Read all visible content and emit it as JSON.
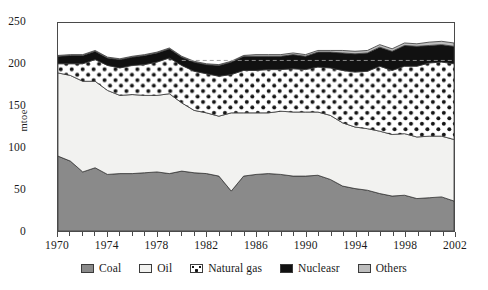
{
  "chart_data": {
    "type": "area",
    "stacked": true,
    "title": "",
    "subtitle": "",
    "xlabel": "",
    "ylabel": "mtoe",
    "xlim": [
      1970,
      2002
    ],
    "ylim": [
      0,
      250
    ],
    "grid": false,
    "legend_position": "bottom",
    "y_ticks": [
      0,
      50,
      100,
      150,
      200,
      250
    ],
    "x_ticks": [
      1970,
      1974,
      1978,
      1982,
      1986,
      1990,
      1994,
      1998,
      2002
    ],
    "x_minor_tick_interval": 1,
    "x": [
      1970,
      1971,
      1972,
      1973,
      1974,
      1975,
      1976,
      1977,
      1978,
      1979,
      1980,
      1981,
      1982,
      1983,
      1984,
      1985,
      1986,
      1987,
      1988,
      1989,
      1990,
      1991,
      1992,
      1993,
      1994,
      1995,
      1996,
      1997,
      1998,
      1999,
      2000,
      2001,
      2002
    ],
    "annotations": [
      {
        "type": "dashed-line",
        "orientation": "horizontal",
        "y": 205,
        "x_start": 1980,
        "x_end": 2002,
        "note": "faint reference line near 205 mtoe"
      }
    ],
    "series": [
      {
        "name": "Coal",
        "color": "#8a8a8a",
        "pattern": "solid-grey",
        "values": [
          90,
          84,
          71,
          76,
          68,
          69,
          69,
          70,
          71,
          69,
          72,
          70,
          69,
          66,
          48,
          66,
          68,
          69,
          68,
          66,
          66,
          67,
          62,
          54,
          51,
          49,
          45,
          42,
          43,
          39,
          40,
          41,
          36
        ]
      },
      {
        "name": "Oil",
        "color": "#f2f2f0",
        "pattern": "solid-light",
        "values": [
          100,
          103,
          109,
          104,
          101,
          94,
          95,
          93,
          92,
          96,
          82,
          75,
          73,
          72,
          94,
          76,
          74,
          73,
          76,
          77,
          77,
          76,
          77,
          76,
          74,
          74,
          75,
          74,
          74,
          74,
          74,
          73,
          74
        ]
      },
      {
        "name": "Natural gas",
        "color": "#ffffff",
        "pattern": "dotted",
        "values": [
          11,
          14,
          21,
          26,
          30,
          33,
          35,
          37,
          40,
          43,
          45,
          47,
          47,
          48,
          46,
          51,
          51,
          52,
          50,
          52,
          51,
          54,
          57,
          63,
          66,
          69,
          78,
          77,
          81,
          85,
          88,
          89,
          91
        ]
      },
      {
        "name": "Nucleasr",
        "color": "#111111",
        "pattern": "solid-black",
        "values": [
          9,
          10,
          10,
          10,
          9,
          10,
          10,
          11,
          11,
          11,
          10,
          11,
          11,
          13,
          15,
          17,
          17,
          16,
          16,
          17,
          16,
          18,
          19,
          21,
          22,
          22,
          23,
          23,
          25,
          24,
          21,
          21,
          21
        ]
      },
      {
        "name": "Others",
        "color": "#bdbdbd",
        "pattern": "solid-light-grey",
        "values": [
          1,
          1,
          1,
          1,
          1,
          1,
          1,
          1,
          1,
          1,
          1,
          1,
          1,
          1,
          1,
          1,
          2,
          2,
          2,
          2,
          2,
          2,
          2,
          3,
          3,
          3,
          3,
          3,
          3,
          3,
          4,
          4,
          4
        ]
      }
    ]
  },
  "legend": {
    "items": [
      {
        "label": "Coal",
        "swatch": "sw-coal",
        "icon": "legend-swatch-coal"
      },
      {
        "label": "Oil",
        "swatch": "sw-oil",
        "icon": "legend-swatch-oil"
      },
      {
        "label": "Natural gas",
        "swatch": "sw-gas",
        "icon": "legend-swatch-natural-gas"
      },
      {
        "label": "Nucleasr",
        "swatch": "sw-nuclear",
        "icon": "legend-swatch-nuclear"
      },
      {
        "label": "Others",
        "swatch": "sw-others",
        "icon": "legend-swatch-others"
      }
    ]
  },
  "axes": {
    "y_title": "mtoe",
    "y_labels": [
      "250",
      "200",
      "150",
      "100",
      "50",
      "0"
    ],
    "x_labels": [
      "1970",
      "1974",
      "1978",
      "1982",
      "1986",
      "1990",
      "1994",
      "1998",
      "2002"
    ]
  },
  "colors": {
    "coal": "#8a8a8a",
    "oil": "#f2f2f0",
    "natural_gas": "#ffffff",
    "nuclear": "#111111",
    "others": "#bdbdbd",
    "axis": "#4a4a4a",
    "background": "#ffffff"
  }
}
